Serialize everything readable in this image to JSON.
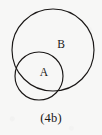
{
  "figure": {
    "caption": "(4b)",
    "background_color": "#f7f7f6",
    "stroke_color": "#1a1716",
    "text_color": "#191615"
  },
  "chart_data": {
    "type": "diagram",
    "diagram_type": "venn",
    "title": "(4b)",
    "relation": "intersecting",
    "sets": [
      {
        "name": "B",
        "label": "B",
        "cx": 53,
        "cy": 50,
        "r": 41,
        "label_x": 61,
        "label_y": 48
      },
      {
        "name": "A",
        "label": "A",
        "cx": 39,
        "cy": 76,
        "r": 24,
        "label_x": 44,
        "label_y": 76
      }
    ],
    "labels": [
      "A",
      "B"
    ],
    "xlabel": "",
    "ylabel": "",
    "legend": []
  }
}
